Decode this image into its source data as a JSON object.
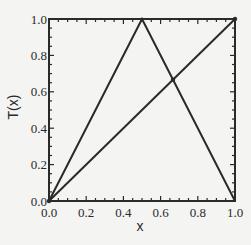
{
  "chart_data": {
    "type": "line",
    "title": "",
    "xlabel": "x",
    "ylabel": "T(x)",
    "xlim": [
      0,
      1
    ],
    "ylim": [
      0,
      1
    ],
    "grid": false,
    "legend": "none",
    "x_ticks": [
      0.0,
      0.2,
      0.4,
      0.6,
      0.8,
      1.0
    ],
    "x_tick_labels": [
      "0.0",
      "0.2",
      "0.4",
      "0.6",
      "0.8",
      "1.0"
    ],
    "y_ticks": [
      0.0,
      0.2,
      0.4,
      0.6,
      0.8,
      1.0
    ],
    "y_tick_labels": [
      "0.0",
      "0.2",
      "0.4",
      "0.6",
      "0.8",
      "1.0"
    ],
    "minor_tick_step": 0.05,
    "series": [
      {
        "name": "tent map T(x)",
        "x": [
          0,
          0.5,
          1
        ],
        "y": [
          0,
          1,
          0
        ],
        "color": "#2a2a2a"
      },
      {
        "name": "identity y=x",
        "x": [
          0,
          1
        ],
        "y": [
          0,
          1
        ],
        "color": "#2a2a2a"
      }
    ],
    "markers": [
      {
        "name": "fixed-point",
        "x": 0.6667,
        "y": 0.6667
      },
      {
        "name": "origin-fixed-point",
        "x": 0,
        "y": 0
      },
      {
        "name": "corner-point",
        "x": 1,
        "y": 1
      }
    ]
  }
}
